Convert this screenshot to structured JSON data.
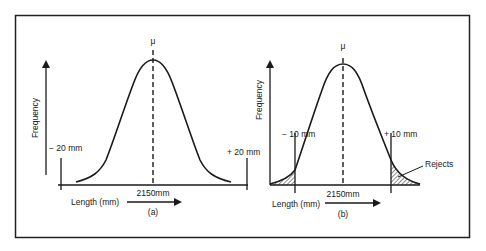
{
  "figure": {
    "frame_color": "#222222",
    "ink_color": "#1a1a1a",
    "panels": [
      {
        "id": "a",
        "caption": "(a)",
        "mean_label": "μ",
        "y_axis_label": "Frequency",
        "x_axis_label": "Length (mm)",
        "center_label": "2150mm",
        "lower_limit_label": "− 20 mm",
        "upper_limit_label": "+ 20 mm",
        "rejects_label": null
      },
      {
        "id": "b",
        "caption": "(b)",
        "mean_label": "μ",
        "y_axis_label": "Frequency",
        "x_axis_label": "Length (mm)",
        "center_label": "2150mm",
        "lower_limit_label": "− 10 mm",
        "upper_limit_label": "+ 10 mm",
        "rejects_label": "Rejects"
      }
    ]
  }
}
